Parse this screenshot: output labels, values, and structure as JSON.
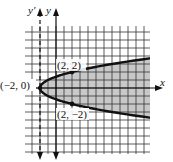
{
  "figure": {
    "type": "graph-of-inequality",
    "equation": "y^2 = x + 2",
    "region": "shaded interior of parabola (x > y^2 - 2)",
    "axes": {
      "x_label": "x",
      "y_label": "y",
      "y_prime_label": "y'"
    },
    "points": [
      {
        "label": "(−2, 0)",
        "x": -2,
        "y": 0
      },
      {
        "label": "(2, 2)",
        "x": 2,
        "y": 2
      },
      {
        "label": "(2, −2)",
        "x": 2,
        "y": -2
      }
    ],
    "colors": {
      "grid": "#333333",
      "shade": "#c8c8c8",
      "curve": "#111111"
    }
  },
  "chart_data": {
    "type": "line",
    "title": "",
    "xlabel": "x",
    "ylabel": "y",
    "curve": "y^2 = x + 2",
    "vertex": [
      -2,
      0
    ],
    "marked_points": [
      [
        -2,
        0
      ],
      [
        2,
        2
      ],
      [
        2,
        -2
      ]
    ],
    "shaded_region": "inside parabola (right of curve)",
    "dashed_axis": "y' at x = -2",
    "grid": true,
    "xlim": [
      -4,
      12
    ],
    "ylim": [
      -8,
      8
    ]
  }
}
